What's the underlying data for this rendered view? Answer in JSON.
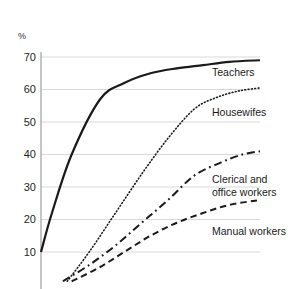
{
  "chart_data": {
    "type": "line",
    "title": "",
    "subtitle": "",
    "xlabel": "",
    "ylabel": "%",
    "axis_unit_label": "%",
    "ylim": [
      0,
      73
    ],
    "xlim": [
      0,
      100
    ],
    "grid": true,
    "grid_axis": "y",
    "legend_position": "inline-right",
    "ytick_labels": [
      "70",
      "60",
      "50",
      "40",
      "30",
      "20",
      "10"
    ],
    "ytick_values": [
      70,
      60,
      50,
      40,
      30,
      20,
      10
    ],
    "xtick_labels": [],
    "series": [
      {
        "name": "Teachers",
        "label": "Teachers",
        "style": "solid",
        "color": "#1a1a1a",
        "width": 2.2,
        "label_x": 212,
        "label_y": 66,
        "x": [
          0,
          5,
          14,
          27,
          38,
          50,
          62,
          74,
          86,
          100
        ],
        "values": [
          10,
          22,
          40,
          57,
          62,
          65,
          66.5,
          67.5,
          68.5,
          69
        ]
      },
      {
        "name": "Housewifes",
        "label": "Housewifes",
        "style": "dotted",
        "color": "#1a1a1a",
        "width": 1.6,
        "label_x": 212,
        "label_y": 106,
        "x": [
          12,
          22,
          34,
          46,
          58,
          70,
          80,
          90,
          100
        ],
        "values": [
          1,
          10,
          22,
          34,
          45,
          54,
          57.5,
          59.5,
          60.5
        ]
      },
      {
        "name": "Clerical and office workers",
        "label": "Clerical and\noffice workers",
        "style": "dashdot",
        "color": "#1a1a1a",
        "width": 2.0,
        "label_x": 212,
        "label_y": 173,
        "x": [
          10,
          22,
          34,
          46,
          58,
          70,
          82,
          92,
          100
        ],
        "values": [
          1,
          6,
          12,
          19,
          26,
          33.5,
          37.5,
          40,
          41
        ]
      },
      {
        "name": "Manual workers",
        "label": "Manual workers",
        "style": "dashed",
        "color": "#1a1a1a",
        "width": 2.0,
        "label_x": 212,
        "label_y": 225,
        "x": [
          14,
          26,
          38,
          50,
          62,
          74,
          86,
          100
        ],
        "values": [
          1,
          5,
          10,
          15,
          19,
          22,
          24.5,
          26
        ]
      }
    ],
    "colors": {
      "line": "#1a1a1a",
      "grid": "#d8d8d8",
      "axis": "#8a8a8a",
      "background": "#ffffff",
      "text": "#1a1a1a"
    }
  },
  "geometry": {
    "plot_left": 41,
    "plot_right": 260,
    "y_at_70": 57,
    "y_at_10": 252,
    "bottom": 289
  }
}
